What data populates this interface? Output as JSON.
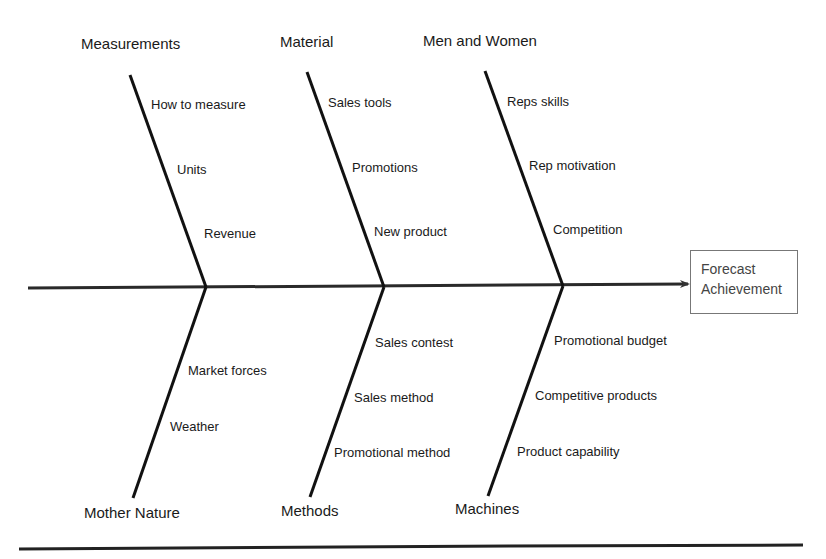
{
  "diagram": {
    "type": "fishbone",
    "effect": {
      "line1": "Forecast",
      "line2": "Achievement"
    },
    "categories": {
      "measurements": {
        "label": "Measurements",
        "causes": [
          "How to measure",
          "Units",
          "Revenue"
        ]
      },
      "material": {
        "label": "Material",
        "causes": [
          "Sales tools",
          "Promotions",
          "New product"
        ]
      },
      "men_and_women": {
        "label": "Men and Women",
        "causes": [
          "Reps skills",
          "Rep motivation",
          "Competition"
        ]
      },
      "mother_nature": {
        "label": "Mother Nature",
        "causes": [
          "Market forces",
          "Weather"
        ]
      },
      "methods": {
        "label": "Methods",
        "causes": [
          "Sales contest",
          "Sales method",
          "Promotional method"
        ]
      },
      "machines": {
        "label": "Machines",
        "causes": [
          "Promotional budget",
          "Competitive products",
          "Product capability"
        ]
      }
    },
    "colors": {
      "line": "#111111",
      "spine": "#2a2a2a",
      "box_border": "#777777",
      "box_text": "#444444"
    }
  }
}
